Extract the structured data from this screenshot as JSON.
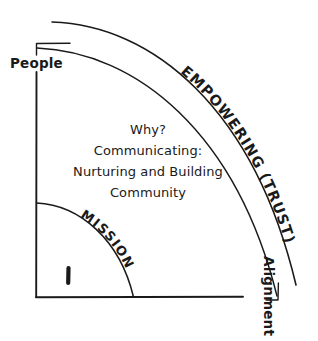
{
  "diagram": {
    "title": "Why? Communicating: Nurturing and Building Community",
    "axes": {
      "vertical_label": "People",
      "horizontal_label": "Alignment"
    },
    "arcs": {
      "outer_label": "EMPOWERING (TRUST)",
      "inner_label": "MISSION"
    },
    "center_text": {
      "line1": "Why?",
      "line2": "Communicating:",
      "line3": "Nurturing and Building",
      "line4": "Community"
    },
    "colors": {
      "ink": "#1a1a1a",
      "background": "#ffffff"
    }
  }
}
